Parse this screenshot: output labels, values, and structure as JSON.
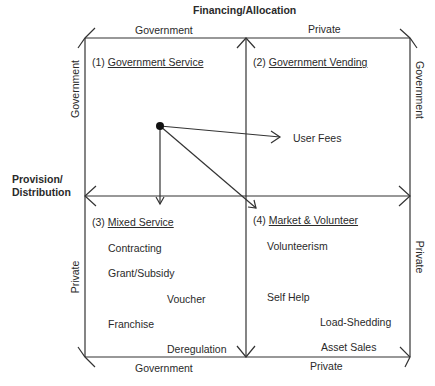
{
  "axes": {
    "top_title": "Financing/Allocation",
    "left_title_line1": "Provision/",
    "left_title_line2": "Distribution",
    "top_left": "Government",
    "top_right": "Private",
    "bottom_left": "Government",
    "bottom_right": "Private",
    "left_upper": "Government",
    "left_lower": "Private",
    "right_upper": "Government",
    "right_lower": "Private"
  },
  "quadrants": [
    {
      "number": "(1)",
      "title": "Government Service",
      "items": []
    },
    {
      "number": "(2)",
      "title": "Government Vending",
      "items": [
        "User Fees"
      ]
    },
    {
      "number": "(3)",
      "title": "Mixed Service",
      "items": [
        "Contracting",
        "Grant/Subsidy",
        "Voucher",
        "Franchise",
        "Deregulation"
      ]
    },
    {
      "number": "(4)",
      "title": "Market & Volunteer",
      "items": [
        "Volunteerism",
        "Self Help",
        "Load-Shedding",
        "Asset Sales"
      ]
    }
  ],
  "colors": {
    "line": "#333333",
    "text": "#2a2a2a",
    "background": "#ffffff"
  }
}
